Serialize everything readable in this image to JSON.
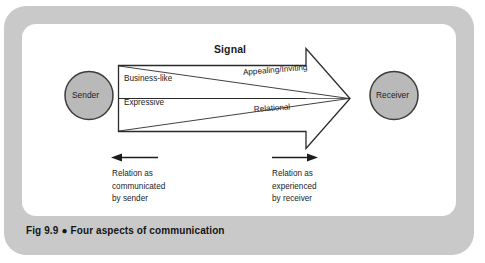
{
  "figure": {
    "caption_prefix": "Fig 9.9",
    "caption_bullet": "●",
    "caption_title": "Four aspects of communication"
  },
  "diagram": {
    "type": "communication-model",
    "sender_node": {
      "label": "Sender",
      "shape": "circle",
      "fill": "#b9b9b9",
      "stroke": "#3d3d3d"
    },
    "receiver_node": {
      "label": "Receiver",
      "shape": "circle",
      "fill": "#b9b9b9",
      "stroke": "#3d3d3d"
    },
    "signal_arrow": {
      "label": "Signal",
      "direction": "left-to-right",
      "fill": "#ffffff",
      "stroke": "#2b2b2b"
    },
    "aspects": [
      {
        "id": "business-like",
        "label": "Business-like",
        "side": "sender",
        "row": "upper"
      },
      {
        "id": "expressive",
        "label": "Expressive",
        "side": "sender",
        "row": "lower"
      },
      {
        "id": "appealing-inviting",
        "label": "Appealing/Inviting",
        "side": "receiver",
        "row": "upper"
      },
      {
        "id": "relational",
        "label": "Relational",
        "side": "receiver",
        "row": "lower"
      }
    ],
    "notes": [
      {
        "id": "relation-communicated-by-sender",
        "arrow_direction": "left",
        "lines": [
          "Relation as",
          "communicated",
          "by sender"
        ]
      },
      {
        "id": "relation-experienced-by-receiver",
        "arrow_direction": "right",
        "lines": [
          "Relation as",
          "experienced",
          "by receiver"
        ]
      }
    ]
  },
  "colors": {
    "outer_frame": "#c9c9c9",
    "inner_panel": "#ffffff",
    "node_fill": "#b9b9b9",
    "line": "#2b2b2b",
    "text": "#1c1c1c"
  }
}
